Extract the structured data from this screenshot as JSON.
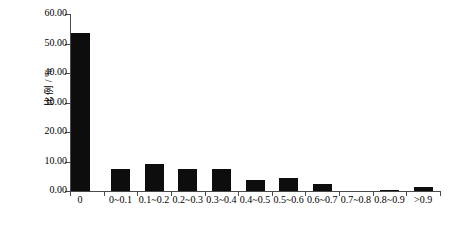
{
  "chart_data": {
    "type": "bar",
    "title": "",
    "xlabel": "",
    "ylabel": "比例 / %",
    "ylim": [
      0,
      60
    ],
    "ytick_labels": [
      "0.00",
      "10.00",
      "20.00",
      "30.00",
      "40.00",
      "50.00",
      "60.00"
    ],
    "ytick_values": [
      0,
      10,
      20,
      30,
      40,
      50,
      60
    ],
    "grid": false,
    "legend": false,
    "bar_color": "#0d0d0d",
    "axis_color": "#4a4a4a",
    "categories": [
      "0",
      "0~0.1",
      "0.1~0.2",
      "0.2~0.3",
      "0.3~0.4",
      "0.4~0.5",
      "0.5~0.6",
      "0.6~0.7",
      "0.7~0.8",
      "0.8~0.9",
      ">0.9"
    ],
    "values": [
      53.6,
      7.6,
      9.2,
      7.5,
      7.4,
      3.6,
      4.3,
      2.3,
      0.0,
      0.4,
      1.3
    ]
  }
}
